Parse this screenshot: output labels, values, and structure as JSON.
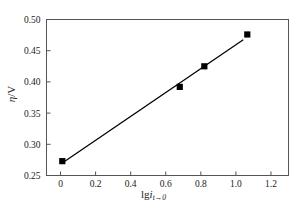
{
  "chart_data": {
    "type": "scatter",
    "title": "",
    "xlabel": "lg i(t→0)",
    "ylabel": "η/V",
    "xlim": [
      -0.08,
      1.3
    ],
    "ylim": [
      0.25,
      0.5
    ],
    "xticks": [
      0,
      0.2,
      0.4,
      0.6,
      0.8,
      1.0,
      1.2
    ],
    "xticklabels": [
      "0",
      "0.2",
      "0.4",
      "0.6",
      "0.8",
      "1.0",
      "1.2"
    ],
    "yticks": [
      0.25,
      0.3,
      0.35,
      0.4,
      0.45,
      0.5
    ],
    "yticklabels": [
      "0.25",
      "0.30",
      "0.35",
      "0.40",
      "0.45",
      "0.50"
    ],
    "grid": false,
    "legend": null,
    "marker": "filled-square",
    "marker_color": "#000000",
    "line_color": "#000000",
    "x": [
      0.01,
      0.68,
      0.82,
      1.065
    ],
    "y": [
      0.273,
      0.392,
      0.425,
      0.476
    ],
    "series": [
      {
        "name": "Tafel data",
        "x": [
          0.01,
          0.68,
          0.82,
          1.065
        ],
        "values": [
          0.273,
          0.392,
          0.425,
          0.476
        ]
      },
      {
        "name": "linear fit",
        "type": "line",
        "x": [
          0.012,
          1.042
        ],
        "values": [
          0.2705,
          0.4675
        ]
      }
    ]
  },
  "axes": {
    "y_title_eta": "η",
    "y_title_slash": "/",
    "y_title_unit": "V",
    "x_title_lg": "lg",
    "x_title_i": "i",
    "x_title_sub": "t→0"
  },
  "style": {
    "frame_color": "#555555",
    "background": "#ffffff",
    "ink": "#000000"
  }
}
